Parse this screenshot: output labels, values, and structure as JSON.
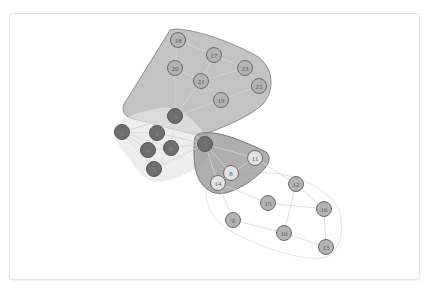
{
  "diagram": {
    "type": "network-graph-with-group-hulls",
    "colors": {
      "group_top_hull": "#b9b9b9",
      "group_top_stroke": "#8e8e8e",
      "group_mid_hull": "#9a9a9a",
      "group_mid_stroke": "#7a7a7a",
      "group_left_hull": "#e6e6e6",
      "group_bottom_hull": "#ffffff",
      "group_bottom_stroke": "#e4e4e4",
      "edge": "#d6d6d6",
      "dark_node_fill": "#6e6e6e",
      "dark_node_stroke": "#555555",
      "mid_node_fill": "#b3b3b3",
      "light_node_fill": "#e2e2e2",
      "node_stroke": "#6b6b6b",
      "label_dark": "#8a8a8a",
      "label": "#5a5a5a"
    },
    "nodes": [
      {
        "id": "1",
        "x": 122,
        "y": 132,
        "group": "dark"
      },
      {
        "id": "2",
        "x": 157,
        "y": 133,
        "group": "dark"
      },
      {
        "id": "3",
        "x": 175,
        "y": 116,
        "group": "dark"
      },
      {
        "id": "4",
        "x": 148,
        "y": 150,
        "group": "dark"
      },
      {
        "id": "5",
        "x": 154,
        "y": 169,
        "group": "dark"
      },
      {
        "id": "6",
        "x": 171,
        "y": 148,
        "group": "dark"
      },
      {
        "id": "7",
        "x": 205,
        "y": 144,
        "group": "dark"
      },
      {
        "id": "8",
        "x": 231,
        "y": 173,
        "group": "light"
      },
      {
        "id": "9",
        "x": 233,
        "y": 220,
        "group": "mid"
      },
      {
        "id": "10",
        "x": 284,
        "y": 233,
        "group": "mid"
      },
      {
        "id": "11",
        "x": 255,
        "y": 158,
        "group": "light"
      },
      {
        "id": "12",
        "x": 296,
        "y": 184,
        "group": "mid"
      },
      {
        "id": "13",
        "x": 326,
        "y": 247,
        "group": "mid"
      },
      {
        "id": "14",
        "x": 218,
        "y": 183,
        "group": "light"
      },
      {
        "id": "15",
        "x": 268,
        "y": 203,
        "group": "mid"
      },
      {
        "id": "16",
        "x": 324,
        "y": 209,
        "group": "mid"
      },
      {
        "id": "17",
        "x": 214,
        "y": 55,
        "group": "mid"
      },
      {
        "id": "18",
        "x": 178,
        "y": 40,
        "group": "mid"
      },
      {
        "id": "19",
        "x": 221,
        "y": 100,
        "group": "mid"
      },
      {
        "id": "20",
        "x": 175,
        "y": 68,
        "group": "mid"
      },
      {
        "id": "21",
        "x": 201,
        "y": 81,
        "group": "mid"
      },
      {
        "id": "22",
        "x": 259,
        "y": 86,
        "group": "mid"
      },
      {
        "id": "23",
        "x": 245,
        "y": 68,
        "group": "mid"
      }
    ],
    "edges": [
      [
        "1",
        "2"
      ],
      [
        "1",
        "3"
      ],
      [
        "1",
        "4"
      ],
      [
        "1",
        "6"
      ],
      [
        "1",
        "5"
      ],
      [
        "2",
        "3"
      ],
      [
        "2",
        "4"
      ],
      [
        "2",
        "6"
      ],
      [
        "3",
        "6"
      ],
      [
        "4",
        "6"
      ],
      [
        "4",
        "5"
      ],
      [
        "6",
        "5"
      ],
      [
        "3",
        "7"
      ],
      [
        "6",
        "7"
      ],
      [
        "2",
        "7"
      ],
      [
        "5",
        "7"
      ],
      [
        "7",
        "8"
      ],
      [
        "7",
        "11"
      ],
      [
        "8",
        "14"
      ],
      [
        "8",
        "11"
      ],
      [
        "7",
        "14"
      ],
      [
        "11",
        "12"
      ],
      [
        "14",
        "15"
      ],
      [
        "14",
        "9"
      ],
      [
        "12",
        "16"
      ],
      [
        "12",
        "10"
      ],
      [
        "15",
        "16"
      ],
      [
        "9",
        "10"
      ],
      [
        "10",
        "13"
      ],
      [
        "16",
        "13"
      ],
      [
        "18",
        "17"
      ],
      [
        "18",
        "20"
      ],
      [
        "20",
        "21"
      ],
      [
        "17",
        "21"
      ],
      [
        "17",
        "23"
      ],
      [
        "21",
        "19"
      ],
      [
        "23",
        "22"
      ],
      [
        "21",
        "23"
      ],
      [
        "19",
        "22"
      ],
      [
        "19",
        "3"
      ],
      [
        "21",
        "3"
      ],
      [
        "20",
        "3"
      ]
    ],
    "hulls": [
      {
        "name": "top-group",
        "path": "M 170 30 C 180 26 220 36 255 55 C 275 66 275 92 262 105 C 245 120 215 130 200 136 L 130 118 C 120 113 122 105 128 98 Z"
      },
      {
        "name": "left-group",
        "path": "M 114 127 C 118 120 135 112 160 108 C 185 104 200 128 212 144 C 212 160 190 176 162 182 C 148 184 138 172 130 160 C 120 148 111 134 114 127 Z"
      },
      {
        "name": "mid-group",
        "path": "M 198 134 C 214 128 246 142 266 152 C 275 160 264 172 246 184 C 232 192 222 196 212 192 C 198 186 194 170 194 152 C 194 142 194 136 198 134 Z"
      },
      {
        "name": "bottom-group",
        "path": "M 206 190 C 220 176 258 168 290 176 C 312 182 334 196 340 212 C 344 232 340 256 322 258 C 300 260 270 250 240 236 C 218 226 205 210 206 190 Z"
      }
    ]
  }
}
